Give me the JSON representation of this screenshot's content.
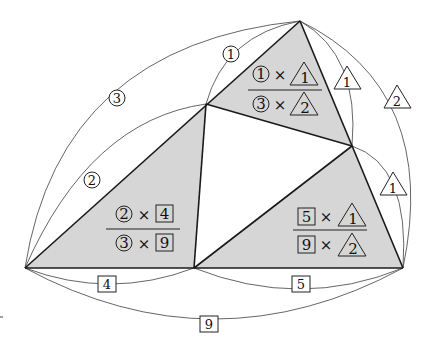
{
  "diagram": {
    "vertices": {
      "top": [
        300,
        21
      ],
      "left_mid": [
        206,
        104
      ],
      "right_mid": [
        352,
        146
      ],
      "bottom_left": [
        25,
        268
      ],
      "bottom_mid": [
        194,
        268
      ],
      "bottom_right": [
        403,
        268
      ]
    },
    "colors": {
      "shade": "#d6d6d6",
      "edge": "#1a1a1a",
      "arc": "#555555"
    },
    "segment_labels": {
      "top_to_leftmid": {
        "text": "1",
        "shape": "circle"
      },
      "top_to_bottomleft": {
        "text": "3",
        "shape": "circle"
      },
      "leftmid_to_bottomleft": {
        "text": "2",
        "shape": "circle"
      },
      "top_to_rightmid": {
        "text": "1",
        "shape": "triangle"
      },
      "top_to_bottomright": {
        "text": "2",
        "shape": "triangle"
      },
      "rightmid_to_bottomright": {
        "text": "1",
        "shape": "triangle"
      },
      "bottomleft_to_bottommid": {
        "text": "4",
        "shape": "square"
      },
      "bottommid_to_bottomright": {
        "text": "5",
        "shape": "square"
      },
      "bottomleft_to_bottomright": {
        "text": "9",
        "shape": "square"
      }
    },
    "fractions": {
      "top": {
        "num_a": "1",
        "num_a_shape": "circle",
        "num_b": "1",
        "num_b_shape": "triangle",
        "den_a": "3",
        "den_a_shape": "circle",
        "den_b": "2",
        "den_b_shape": "triangle",
        "times": "×"
      },
      "left": {
        "num_a": "2",
        "num_a_shape": "circle",
        "num_b": "4",
        "num_b_shape": "square",
        "den_a": "3",
        "den_a_shape": "circle",
        "den_b": "9",
        "den_b_shape": "square",
        "times": "×"
      },
      "right": {
        "num_a": "5",
        "num_a_shape": "square",
        "num_b": "1",
        "num_b_shape": "triangle",
        "den_a": "9",
        "den_a_shape": "square",
        "den_b": "2",
        "den_b_shape": "triangle",
        "times": "×"
      }
    }
  }
}
